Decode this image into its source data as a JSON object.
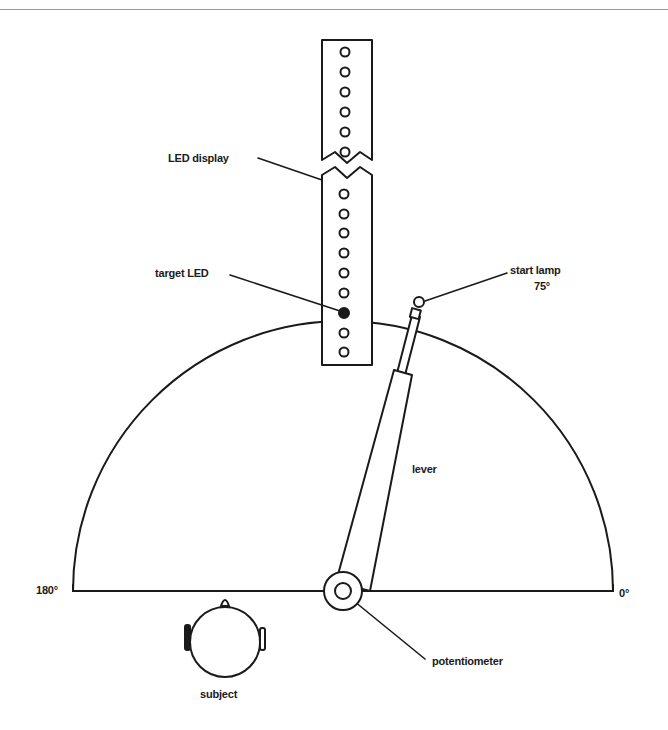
{
  "figure": {
    "type": "apparatus-schematic",
    "labels": {
      "led_display": "LED display",
      "target_led": "target LED",
      "start_lamp": "start lamp",
      "start_angle": "75°",
      "lever": "lever",
      "potentiometer": "potentiometer",
      "subject": "subject",
      "angle_left": "180°",
      "angle_right": "0°"
    },
    "led_display": {
      "upper_segment_led_count": 6,
      "lower_segment_led_count": 9,
      "target_led_index_in_lower_segment": 6
    },
    "lever_angle_deg": 75,
    "colors": {
      "ink": "#1a1a1a",
      "background": "#ffffff"
    }
  }
}
